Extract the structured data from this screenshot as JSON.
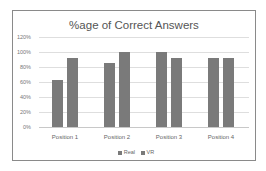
{
  "chart_data": {
    "type": "bar",
    "title": "%age of Correct Answers",
    "categories": [
      "Position 1",
      "Position 2",
      "Position 3",
      "Position 4"
    ],
    "series": [
      {
        "name": "Real",
        "values": [
          63,
          85,
          100,
          92
        ],
        "color": "#7a7a7a"
      },
      {
        "name": "VR",
        "values": [
          92,
          100,
          92,
          92
        ],
        "color": "#7a7a7a"
      }
    ],
    "xlabel": "",
    "ylabel": "",
    "ylim": [
      0,
      120
    ],
    "yticks": [
      "0%",
      "20%",
      "40%",
      "60%",
      "80%",
      "100%",
      "120%"
    ],
    "grid": true,
    "legend_position": "bottom"
  }
}
